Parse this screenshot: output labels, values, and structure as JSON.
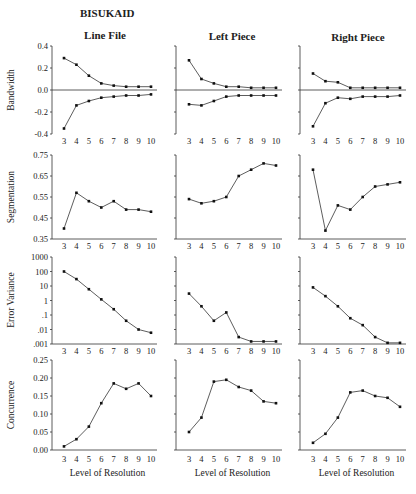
{
  "figure": {
    "title": "BISUKAID",
    "columns": [
      "Line File",
      "Left Piece",
      "Right Piece"
    ],
    "x_label": "Level of Resolution",
    "x_ticks": [
      "3",
      "4",
      "5",
      "6",
      "7",
      "8",
      "9",
      "10"
    ]
  },
  "chart_data": [
    {
      "type": "line",
      "title": "Line File — Bandwidth",
      "xlabel": "",
      "ylabel": "Bandwidth",
      "x": [
        3,
        4,
        5,
        6,
        7,
        8,
        9,
        10
      ],
      "ylim": [
        -0.4,
        0.4
      ],
      "yticks": [
        "0.4",
        "0.2",
        "0.0",
        "-0.2",
        "-0.4"
      ],
      "series": [
        {
          "name": "upper",
          "values": [
            0.29,
            0.23,
            0.13,
            0.06,
            0.04,
            0.03,
            0.03,
            0.03
          ]
        },
        {
          "name": "lower",
          "values": [
            -0.35,
            -0.14,
            -0.1,
            -0.07,
            -0.06,
            -0.05,
            -0.05,
            -0.04
          ]
        }
      ]
    },
    {
      "type": "line",
      "title": "Left Piece — Bandwidth",
      "xlabel": "",
      "ylabel": "Bandwidth",
      "x": [
        3,
        4,
        5,
        6,
        7,
        8,
        9,
        10
      ],
      "ylim": [
        -0.4,
        0.4
      ],
      "series": [
        {
          "name": "upper",
          "values": [
            0.27,
            0.1,
            0.06,
            0.03,
            0.03,
            0.02,
            0.02,
            0.02
          ]
        },
        {
          "name": "lower",
          "values": [
            -0.13,
            -0.14,
            -0.1,
            -0.06,
            -0.05,
            -0.05,
            -0.05,
            -0.05
          ]
        }
      ]
    },
    {
      "type": "line",
      "title": "Right Piece — Bandwidth",
      "xlabel": "",
      "ylabel": "Bandwidth",
      "x": [
        3,
        4,
        5,
        6,
        7,
        8,
        9,
        10
      ],
      "ylim": [
        -0.4,
        0.4
      ],
      "series": [
        {
          "name": "upper",
          "values": [
            0.15,
            0.08,
            0.07,
            0.02,
            0.02,
            0.02,
            0.02,
            0.02
          ]
        },
        {
          "name": "lower",
          "values": [
            -0.33,
            -0.12,
            -0.07,
            -0.08,
            -0.06,
            -0.06,
            -0.06,
            -0.05
          ]
        }
      ]
    },
    {
      "type": "line",
      "title": "Line File — Segmentation",
      "xlabel": "",
      "ylabel": "Segmentation",
      "x": [
        3,
        4,
        5,
        6,
        7,
        8,
        9,
        10
      ],
      "ylim": [
        0.35,
        0.75
      ],
      "yticks": [
        "0.75",
        "0.65",
        "0.55",
        "0.45",
        "0.35"
      ],
      "series": [
        {
          "name": "Segmentation",
          "values": [
            0.4,
            0.57,
            0.53,
            0.5,
            0.53,
            0.49,
            0.49,
            0.48
          ]
        }
      ]
    },
    {
      "type": "line",
      "title": "Left Piece — Segmentation",
      "xlabel": "",
      "ylabel": "Segmentation",
      "x": [
        3,
        4,
        5,
        6,
        7,
        8,
        9,
        10
      ],
      "ylim": [
        0.35,
        0.75
      ],
      "series": [
        {
          "name": "Segmentation",
          "values": [
            0.54,
            0.52,
            0.53,
            0.55,
            0.65,
            0.68,
            0.71,
            0.7
          ]
        }
      ]
    },
    {
      "type": "line",
      "title": "Right Piece — Segmentation",
      "xlabel": "",
      "ylabel": "Segmentation",
      "x": [
        3,
        4,
        5,
        6,
        7,
        8,
        9,
        10
      ],
      "ylim": [
        0.35,
        0.75
      ],
      "series": [
        {
          "name": "Segmentation",
          "values": [
            0.68,
            0.39,
            0.51,
            0.49,
            0.55,
            0.6,
            0.61,
            0.62
          ]
        }
      ]
    },
    {
      "type": "line",
      "title": "Line File — Error Variance",
      "xlabel": "",
      "ylabel": "Error Variance",
      "yscale": "log",
      "x": [
        3,
        4,
        5,
        6,
        7,
        8,
        9,
        10
      ],
      "ylim": [
        0.001,
        1000
      ],
      "yticks": [
        "1000",
        "100",
        "10",
        "1",
        ".1",
        ".01",
        ".001"
      ],
      "series": [
        {
          "name": "Error Variance",
          "values": [
            100,
            30,
            6,
            1.2,
            0.25,
            0.04,
            0.01,
            0.006
          ]
        }
      ]
    },
    {
      "type": "line",
      "title": "Left Piece — Error Variance",
      "xlabel": "",
      "ylabel": "Error Variance",
      "yscale": "log",
      "x": [
        3,
        4,
        5,
        6,
        7,
        8,
        9,
        10
      ],
      "ylim": [
        0.001,
        1000
      ],
      "series": [
        {
          "name": "Error Variance",
          "values": [
            3,
            0.4,
            0.04,
            0.15,
            0.003,
            0.0015,
            0.0015,
            0.0015
          ]
        }
      ]
    },
    {
      "type": "line",
      "title": "Right Piece — Error Variance",
      "xlabel": "",
      "ylabel": "Error Variance",
      "yscale": "log",
      "x": [
        3,
        4,
        5,
        6,
        7,
        8,
        9,
        10
      ],
      "ylim": [
        0.001,
        1000
      ],
      "series": [
        {
          "name": "Error Variance",
          "values": [
            8,
            2,
            0.4,
            0.06,
            0.02,
            0.003,
            0.0012,
            0.0012
          ]
        }
      ]
    },
    {
      "type": "line",
      "title": "Line File — Concurrence",
      "xlabel": "Level of Resolution",
      "ylabel": "Concurrence",
      "x": [
        3,
        4,
        5,
        6,
        7,
        8,
        9,
        10
      ],
      "ylim": [
        0.0,
        0.25
      ],
      "yticks": [
        "0.25",
        "0.20",
        "0.15",
        "0.10",
        "0.05",
        "0.00"
      ],
      "series": [
        {
          "name": "Concurrence",
          "values": [
            0.01,
            0.03,
            0.065,
            0.13,
            0.185,
            0.17,
            0.185,
            0.15
          ]
        }
      ]
    },
    {
      "type": "line",
      "title": "Left Piece — Concurrence",
      "xlabel": "Level of Resolution",
      "ylabel": "Concurrence",
      "x": [
        3,
        4,
        5,
        6,
        7,
        8,
        9,
        10
      ],
      "ylim": [
        0.0,
        0.25
      ],
      "series": [
        {
          "name": "Concurrence",
          "values": [
            0.05,
            0.09,
            0.19,
            0.195,
            0.175,
            0.165,
            0.135,
            0.13
          ]
        }
      ]
    },
    {
      "type": "line",
      "title": "Right Piece — Concurrence",
      "xlabel": "Level of Resolution",
      "ylabel": "Concurrence",
      "x": [
        3,
        4,
        5,
        6,
        7,
        8,
        9,
        10
      ],
      "ylim": [
        0.0,
        0.25
      ],
      "series": [
        {
          "name": "Concurrence",
          "values": [
            0.02,
            0.045,
            0.09,
            0.16,
            0.165,
            0.15,
            0.145,
            0.12
          ]
        }
      ]
    }
  ]
}
